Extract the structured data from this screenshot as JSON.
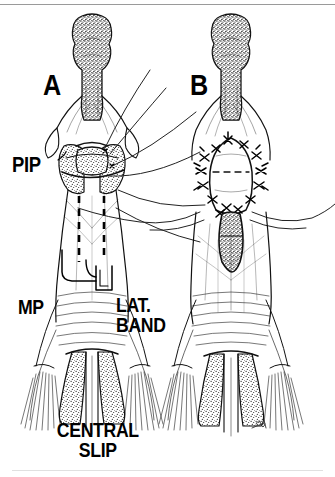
{
  "figure": {
    "style": "pen-and-ink medical illustration",
    "background_color": "#ffffff",
    "ink_color": "#000000",
    "border_color": "#b8b8b8",
    "panel_count": 2
  },
  "panels": [
    {
      "id": "A",
      "label": "A",
      "caption": "Exposure with traction sutures and dashed incision outline",
      "side": "left"
    },
    {
      "id": "B",
      "label": "B",
      "caption": "Completed suture repair of central slip",
      "side": "right"
    }
  ],
  "labels": {
    "panel_a": "A",
    "panel_b": "B",
    "pip": "PIP",
    "mp": "MP",
    "lateral_band": "LAT.\nBAND",
    "central_slip": "CENTRAL\nSLIP"
  },
  "annotations": {
    "pip_target": "proximal interphalangeal joint",
    "mp_target": "middle phalanx",
    "lateral_band_target": "lateral band of extensor hood",
    "central_slip_target": "central slip insertion"
  },
  "features": {
    "bone_texture": "stippled",
    "suture_knot_shape": "x-knot",
    "incision_line_style": "dashed",
    "suture_thread_count": 4,
    "knot_count_panel_b": 14,
    "artist_signature": true
  }
}
